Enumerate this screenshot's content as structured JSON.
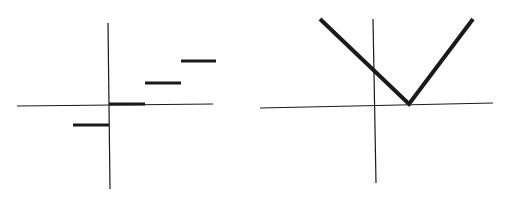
{
  "colors": {
    "background": "#ffffff",
    "axis": "#1a1a1a",
    "curve": "#1a1a1a"
  },
  "graphs": [
    {
      "name": "step-function-graph",
      "description": "Greatest-integer (floor) step function",
      "axes": {
        "x_axis": {
          "x1": 17,
          "y1": 106,
          "x2": 213,
          "y2": 104
        },
        "y_axis": {
          "x1": 108,
          "y1": 23,
          "x2": 110,
          "y2": 189
        }
      },
      "segments": [
        {
          "x_from": -1,
          "x_to": 0,
          "y": -1,
          "px": {
            "x1": 73,
            "y1": 125,
            "x2": 109,
            "y2": 125
          }
        },
        {
          "x_from": 0,
          "x_to": 1,
          "y": 0,
          "px": {
            "x1": 109,
            "y1": 104,
            "x2": 145,
            "y2": 104
          }
        },
        {
          "x_from": 1,
          "x_to": 2,
          "y": 1,
          "px": {
            "x1": 145,
            "y1": 83,
            "x2": 181,
            "y2": 83
          }
        },
        {
          "x_from": 2,
          "x_to": 3,
          "y": 2,
          "px": {
            "x1": 181,
            "y1": 61,
            "x2": 216,
            "y2": 61
          }
        }
      ]
    },
    {
      "name": "absolute-value-graph",
      "description": "V-shaped absolute value graph y = |x - 1|",
      "axes": {
        "x_axis": {
          "x1": 260,
          "y1": 108,
          "x2": 493,
          "y2": 103
        },
        "y_axis": {
          "x1": 373,
          "y1": 19,
          "x2": 376,
          "y2": 183
        }
      },
      "vertex": {
        "x": 1,
        "y": 0
      },
      "polyline": [
        [
          320,
          19
        ],
        [
          409,
          104
        ],
        [
          473,
          19
        ]
      ]
    }
  ]
}
